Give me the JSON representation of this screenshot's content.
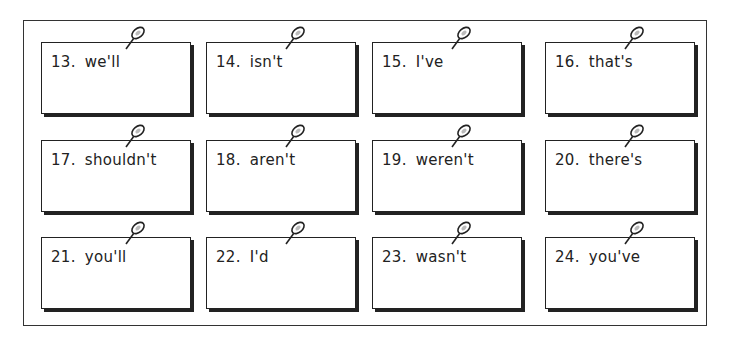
{
  "worksheet": {
    "cards": [
      {
        "number": "13.",
        "word": "we'll"
      },
      {
        "number": "14.",
        "word": "isn't"
      },
      {
        "number": "15.",
        "word": "I've"
      },
      {
        "number": "16.",
        "word": "that's"
      },
      {
        "number": "17.",
        "word": "shouldn't"
      },
      {
        "number": "18.",
        "word": "aren't"
      },
      {
        "number": "19.",
        "word": "weren't"
      },
      {
        "number": "20.",
        "word": "there's"
      },
      {
        "number": "21.",
        "word": "you'll"
      },
      {
        "number": "22.",
        "word": "I'd"
      },
      {
        "number": "23.",
        "word": "wasn't"
      },
      {
        "number": "24.",
        "word": "you've"
      }
    ],
    "icons": {
      "pin": "pushpin-icon"
    }
  }
}
